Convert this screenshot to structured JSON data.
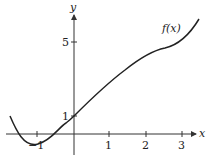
{
  "graph": {
    "function_label": "f(x)",
    "x_axis_label": "x",
    "y_axis_label": "y",
    "x_ticks": [
      {
        "value": -1,
        "label": "−1"
      },
      {
        "value": 1,
        "label": "1"
      },
      {
        "value": 2,
        "label": "2"
      },
      {
        "value": 3,
        "label": "3"
      }
    ],
    "y_ticks": [
      {
        "value": 1,
        "label": "1"
      },
      {
        "value": 5,
        "label": "5"
      }
    ],
    "colors": {
      "axis": "#333333",
      "curve": "#222222"
    }
  }
}
